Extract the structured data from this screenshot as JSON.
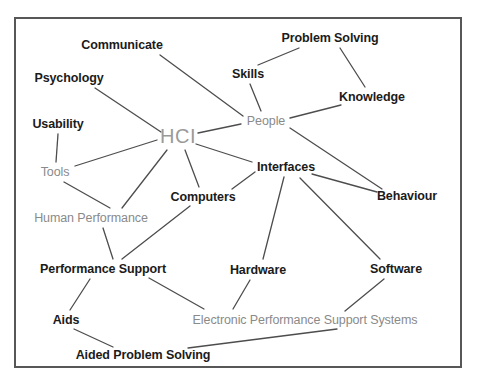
{
  "diagram": {
    "frame": {
      "x": 14,
      "y": 17,
      "width": 448,
      "height": 351,
      "border_color": "#575757"
    },
    "colors": {
      "dark_label": "#1b1b1b",
      "grey_label": "#8a8a8a",
      "hub_label": "#9a9a9a",
      "edge": "#4d4d4d",
      "background": "#ffffff"
    },
    "nodes": [
      {
        "id": "communicate",
        "label": "Communicate",
        "x": 122,
        "y": 45,
        "style": "dark"
      },
      {
        "id": "problem_solving",
        "label": "Problem Solving",
        "x": 330,
        "y": 38,
        "style": "dark"
      },
      {
        "id": "psychology",
        "label": "Psychology",
        "x": 69,
        "y": 78,
        "style": "dark"
      },
      {
        "id": "skills",
        "label": "Skills",
        "x": 248,
        "y": 74,
        "style": "dark"
      },
      {
        "id": "knowledge",
        "label": "Knowledge",
        "x": 372,
        "y": 97,
        "style": "dark"
      },
      {
        "id": "usability",
        "label": "Usability",
        "x": 58,
        "y": 124,
        "style": "dark"
      },
      {
        "id": "hci",
        "label": "HCI",
        "x": 178,
        "y": 136,
        "style": "hub"
      },
      {
        "id": "people",
        "label": "People",
        "x": 266,
        "y": 121,
        "style": "grey"
      },
      {
        "id": "tools",
        "label": "Tools",
        "x": 55,
        "y": 172,
        "style": "grey"
      },
      {
        "id": "interfaces",
        "label": "Interfaces",
        "x": 286,
        "y": 167,
        "style": "dark"
      },
      {
        "id": "computers",
        "label": "Computers",
        "x": 203,
        "y": 197,
        "style": "dark"
      },
      {
        "id": "behaviour",
        "label": "Behaviour",
        "x": 407,
        "y": 196,
        "style": "dark"
      },
      {
        "id": "human_performance",
        "label": "Human Performance",
        "x": 91,
        "y": 218,
        "style": "grey"
      },
      {
        "id": "performance_support",
        "label": "Performance Support",
        "x": 103,
        "y": 269,
        "style": "dark"
      },
      {
        "id": "hardware",
        "label": "Hardware",
        "x": 258,
        "y": 270,
        "style": "dark"
      },
      {
        "id": "software",
        "label": "Software",
        "x": 396,
        "y": 269,
        "style": "dark"
      },
      {
        "id": "aids",
        "label": "Aids",
        "x": 66,
        "y": 320,
        "style": "dark"
      },
      {
        "id": "epss",
        "label": "Electronic Performance Support Systems",
        "x": 305,
        "y": 320,
        "style": "grey"
      },
      {
        "id": "aided_problem_solving",
        "label": "Aided Problem Solving",
        "x": 143,
        "y": 355,
        "style": "dark"
      }
    ],
    "edges": [
      {
        "from": "communicate",
        "to": "people",
        "x1": 160,
        "y1": 55,
        "x2": 243,
        "y2": 116
      },
      {
        "from": "psychology",
        "to": "hci",
        "x1": 95,
        "y1": 88,
        "x2": 161,
        "y2": 132
      },
      {
        "from": "usability",
        "to": "tools",
        "x1": 58,
        "y1": 134,
        "x2": 56,
        "y2": 162
      },
      {
        "from": "tools",
        "to": "hci",
        "x1": 75,
        "y1": 166,
        "x2": 157,
        "y2": 140
      },
      {
        "from": "tools",
        "to": "human_performance",
        "x1": 64,
        "y1": 182,
        "x2": 110,
        "y2": 208
      },
      {
        "from": "hci",
        "to": "people",
        "x1": 198,
        "y1": 133,
        "x2": 241,
        "y2": 124
      },
      {
        "from": "hci",
        "to": "interfaces",
        "x1": 196,
        "y1": 144,
        "x2": 252,
        "y2": 162
      },
      {
        "from": "hci",
        "to": "computers",
        "x1": 185,
        "y1": 150,
        "x2": 199,
        "y2": 187
      },
      {
        "from": "hci",
        "to": "human_performance",
        "x1": 167,
        "y1": 150,
        "x2": 122,
        "y2": 208
      },
      {
        "from": "problem_solving",
        "to": "skills",
        "x1": 299,
        "y1": 48,
        "x2": 258,
        "y2": 65
      },
      {
        "from": "problem_solving",
        "to": "knowledge",
        "x1": 340,
        "y1": 48,
        "x2": 365,
        "y2": 87
      },
      {
        "from": "skills",
        "to": "people",
        "x1": 250,
        "y1": 84,
        "x2": 261,
        "y2": 111
      },
      {
        "from": "knowledge",
        "to": "people",
        "x1": 341,
        "y1": 105,
        "x2": 290,
        "y2": 118
      },
      {
        "from": "people",
        "to": "behaviour",
        "x1": 290,
        "y1": 128,
        "x2": 382,
        "y2": 189
      },
      {
        "from": "interfaces",
        "to": "computers",
        "x1": 255,
        "y1": 172,
        "x2": 232,
        "y2": 189
      },
      {
        "from": "interfaces",
        "to": "behaviour",
        "x1": 312,
        "y1": 174,
        "x2": 377,
        "y2": 192
      },
      {
        "from": "interfaces",
        "to": "hardware",
        "x1": 284,
        "y1": 177,
        "x2": 263,
        "y2": 259
      },
      {
        "from": "interfaces",
        "to": "software",
        "x1": 300,
        "y1": 178,
        "x2": 380,
        "y2": 259
      },
      {
        "from": "computers",
        "to": "performance_support",
        "x1": 190,
        "y1": 206,
        "x2": 122,
        "y2": 259
      },
      {
        "from": "human_performance",
        "to": "performance_support",
        "x1": 103,
        "y1": 228,
        "x2": 113,
        "y2": 259
      },
      {
        "from": "performance_support",
        "to": "aids",
        "x1": 90,
        "y1": 279,
        "x2": 70,
        "y2": 310
      },
      {
        "from": "performance_support",
        "to": "epss",
        "x1": 149,
        "y1": 278,
        "x2": 204,
        "y2": 309
      },
      {
        "from": "hardware",
        "to": "epss",
        "x1": 250,
        "y1": 280,
        "x2": 233,
        "y2": 309
      },
      {
        "from": "software",
        "to": "epss",
        "x1": 384,
        "y1": 279,
        "x2": 345,
        "y2": 311
      },
      {
        "from": "aids",
        "to": "aided_problem_solving",
        "x1": 74,
        "y1": 329,
        "x2": 113,
        "y2": 347
      },
      {
        "from": "epss",
        "to": "aided_problem_solving",
        "x1": 337,
        "y1": 329,
        "x2": 188,
        "y2": 348
      }
    ]
  }
}
